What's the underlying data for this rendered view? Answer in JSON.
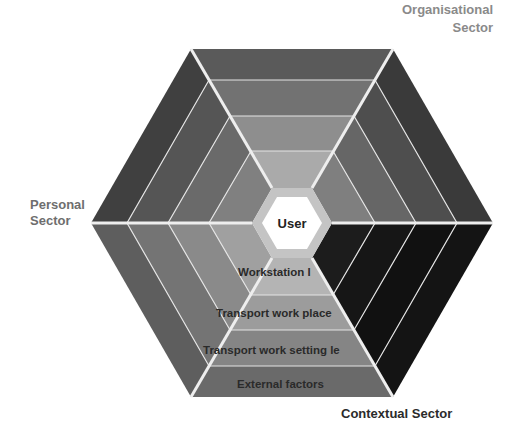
{
  "diagram": {
    "center_label": "User",
    "sectors": [
      {
        "name": "Organisational Sector",
        "label_lines": [
          "Organisational",
          "Sector"
        ],
        "label_color": "#8a8a8a"
      },
      {
        "name": "Personal Sector",
        "label_lines": [
          "Personal",
          "Sector"
        ],
        "label_color": "#6e6e6e"
      },
      {
        "name": "Contextual Sector",
        "label_lines": [
          "Contextual Sector"
        ],
        "label_color": "#2b2b2b"
      }
    ],
    "bottom_bands": [
      {
        "label": "Workstation l"
      },
      {
        "label": "Transport work place"
      },
      {
        "label": "Transport work setting le"
      },
      {
        "label": "External factors"
      }
    ],
    "colors": {
      "separator": "#e6e6e6",
      "user_fill": "#ffffff",
      "user_ring": "#bdbdbd",
      "dark_sector": "#111111"
    }
  }
}
